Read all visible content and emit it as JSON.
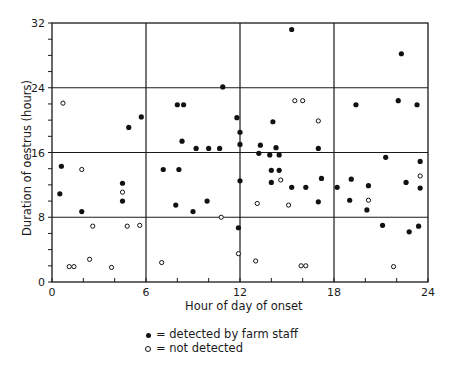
{
  "chart_data": {
    "type": "scatter",
    "title": "",
    "xlabel": "Hour of day of onset",
    "ylabel": "Duration of oestrus (hours)",
    "xlim": [
      0,
      24
    ],
    "ylim": [
      0,
      32
    ],
    "x_ticks": [
      0,
      6,
      12,
      18,
      24
    ],
    "y_ticks": [
      0,
      8,
      16,
      24,
      32
    ],
    "x_minor_step": 2,
    "y_minor_step": 2,
    "grid": true,
    "grid_lines": {
      "x": [
        6,
        12,
        18
      ],
      "y": [
        8,
        16,
        24
      ]
    },
    "legend_position": "below",
    "series": [
      {
        "name": "detected by farm staff",
        "marker": "filled",
        "points": [
          [
            0.6,
            14.3
          ],
          [
            0.5,
            10.9
          ],
          [
            1.9,
            8.7
          ],
          [
            4.5,
            12.2
          ],
          [
            4.5,
            10.0
          ],
          [
            4.9,
            19.1
          ],
          [
            5.7,
            20.4
          ],
          [
            10.9,
            24.1
          ],
          [
            8.0,
            21.9
          ],
          [
            8.4,
            21.9
          ],
          [
            11.8,
            20.3
          ],
          [
            12.0,
            18.5
          ],
          [
            12.0,
            17.0
          ],
          [
            8.3,
            17.4
          ],
          [
            9.2,
            16.5
          ],
          [
            10.0,
            16.5
          ],
          [
            10.7,
            16.5
          ],
          [
            7.1,
            13.9
          ],
          [
            8.1,
            13.9
          ],
          [
            12.0,
            12.5
          ],
          [
            7.9,
            9.5
          ],
          [
            9.9,
            10.0
          ],
          [
            9.0,
            8.7
          ],
          [
            11.9,
            6.7
          ],
          [
            15.3,
            31.2
          ],
          [
            14.1,
            19.8
          ],
          [
            13.3,
            16.9
          ],
          [
            14.3,
            16.6
          ],
          [
            17.0,
            16.5
          ],
          [
            13.2,
            15.9
          ],
          [
            13.9,
            15.7
          ],
          [
            14.5,
            15.7
          ],
          [
            14.0,
            13.8
          ],
          [
            14.5,
            13.8
          ],
          [
            14.0,
            12.3
          ],
          [
            17.2,
            12.8
          ],
          [
            15.3,
            11.7
          ],
          [
            16.2,
            11.7
          ],
          [
            17.0,
            9.9
          ],
          [
            18.2,
            11.7
          ],
          [
            22.3,
            28.2
          ],
          [
            19.4,
            21.9
          ],
          [
            22.1,
            22.4
          ],
          [
            23.3,
            21.9
          ],
          [
            21.3,
            15.4
          ],
          [
            23.5,
            14.9
          ],
          [
            19.1,
            12.7
          ],
          [
            22.6,
            12.3
          ],
          [
            20.2,
            11.9
          ],
          [
            23.5,
            11.6
          ],
          [
            19.0,
            10.1
          ],
          [
            20.1,
            8.9
          ],
          [
            21.1,
            7.0
          ],
          [
            22.8,
            6.2
          ],
          [
            23.4,
            6.9
          ]
        ]
      },
      {
        "name": "not detected",
        "marker": "open",
        "points": [
          [
            0.7,
            22.1
          ],
          [
            1.9,
            13.9
          ],
          [
            4.5,
            11.1
          ],
          [
            2.6,
            6.9
          ],
          [
            4.8,
            6.9
          ],
          [
            5.6,
            7.0
          ],
          [
            1.1,
            1.9
          ],
          [
            1.4,
            1.9
          ],
          [
            2.4,
            2.8
          ],
          [
            3.8,
            1.8
          ],
          [
            10.8,
            8.0
          ],
          [
            11.9,
            3.5
          ],
          [
            7.0,
            2.4
          ],
          [
            15.5,
            22.4
          ],
          [
            16.0,
            22.4
          ],
          [
            17.0,
            19.9
          ],
          [
            14.6,
            12.6
          ],
          [
            13.1,
            9.7
          ],
          [
            15.1,
            9.5
          ],
          [
            13.0,
            2.6
          ],
          [
            15.9,
            2.0
          ],
          [
            16.2,
            2.0
          ],
          [
            23.5,
            13.1
          ],
          [
            20.2,
            10.1
          ],
          [
            21.8,
            1.9
          ]
        ]
      }
    ]
  },
  "legend": {
    "items": [
      {
        "symbol": "filled-dot",
        "label": "= detected by farm staff"
      },
      {
        "symbol": "open-dot",
        "label": "= not detected"
      }
    ]
  },
  "colors": {
    "ink": "#1a1a1a",
    "background": "#ffffff"
  }
}
